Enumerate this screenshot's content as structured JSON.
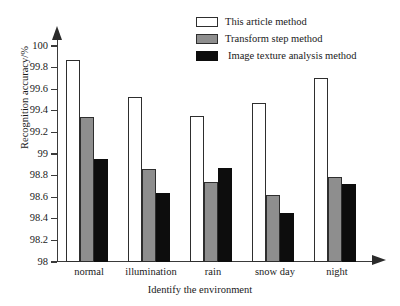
{
  "chart_data": {
    "type": "bar",
    "title": "",
    "xlabel": "Identify the environment",
    "ylabel": "Recognition accuracy/%",
    "categories": [
      "normal",
      "illumination",
      "rain",
      "snow day",
      "night"
    ],
    "series": [
      {
        "name": "This article method",
        "color": "#ffffff",
        "values": [
          99.87,
          99.53,
          99.35,
          99.47,
          99.7
        ]
      },
      {
        "name": "Transform step method",
        "color": "#8e8e8e",
        "values": [
          99.34,
          98.86,
          98.74,
          98.62,
          98.79
        ]
      },
      {
        "name": "Image texture analysis method",
        "color": "#0d0d0d",
        "values": [
          98.95,
          98.64,
          98.87,
          98.45,
          98.72
        ]
      }
    ],
    "ylim": [
      98,
      100
    ],
    "yticks": [
      98,
      98.2,
      98.4,
      98.6,
      98.8,
      99,
      99.2,
      99.4,
      99.6,
      99.8,
      100
    ],
    "ytick_labels": [
      "98",
      "98.2",
      "98.4",
      "98.6",
      "98.8",
      "99",
      "99.2",
      "99.4",
      "99.6",
      "99.8",
      "100"
    ],
    "grid": false,
    "legend_position": "top-right"
  }
}
